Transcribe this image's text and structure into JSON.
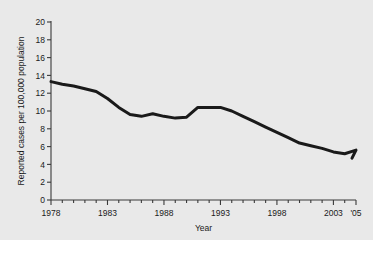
{
  "chart_data": {
    "type": "line",
    "title": "",
    "xlabel": "Year",
    "ylabel": "Reported cases per 100,000 population",
    "xlim": [
      1978,
      2005
    ],
    "ylim": [
      0,
      20
    ],
    "ytick_step": 2,
    "yticks": [
      0,
      2,
      4,
      6,
      8,
      10,
      12,
      14,
      16,
      18,
      20
    ],
    "ytick_labels": [
      "0",
      "2",
      "4",
      "6",
      "8",
      "10",
      "12",
      "14",
      "16",
      "18",
      "20"
    ],
    "xticks": [
      1978,
      1983,
      1988,
      1993,
      1998,
      2003,
      2005
    ],
    "xtick_labels": [
      "1978",
      "1983",
      "1988",
      "1993",
      "1998",
      "2003",
      "'05"
    ],
    "minor_xticks_every": 1,
    "grid": false,
    "legend": null,
    "line_color": "#1a1a1a",
    "line_width": 3,
    "background_color": "#e9e9e9",
    "x": [
      1978,
      1979,
      1980,
      1981,
      1982,
      1983,
      1984,
      1985,
      1986,
      1987,
      1988,
      1989,
      1990,
      1991,
      1992,
      1993,
      1994,
      1995,
      1996,
      1997,
      1998,
      1999,
      2000,
      2001,
      2002,
      2003,
      2004,
      2005
    ],
    "values": [
      13.3,
      13.0,
      12.8,
      12.5,
      12.2,
      11.4,
      10.4,
      9.6,
      9.4,
      9.7,
      9.4,
      9.2,
      9.3,
      10.4,
      10.4,
      10.4,
      10.0,
      9.4,
      8.8,
      8.2,
      7.6,
      7.0,
      6.4,
      6.1,
      5.8,
      5.4,
      5.2,
      5.6
    ],
    "values_end": 4.7,
    "series_name": "Reported cases"
  }
}
